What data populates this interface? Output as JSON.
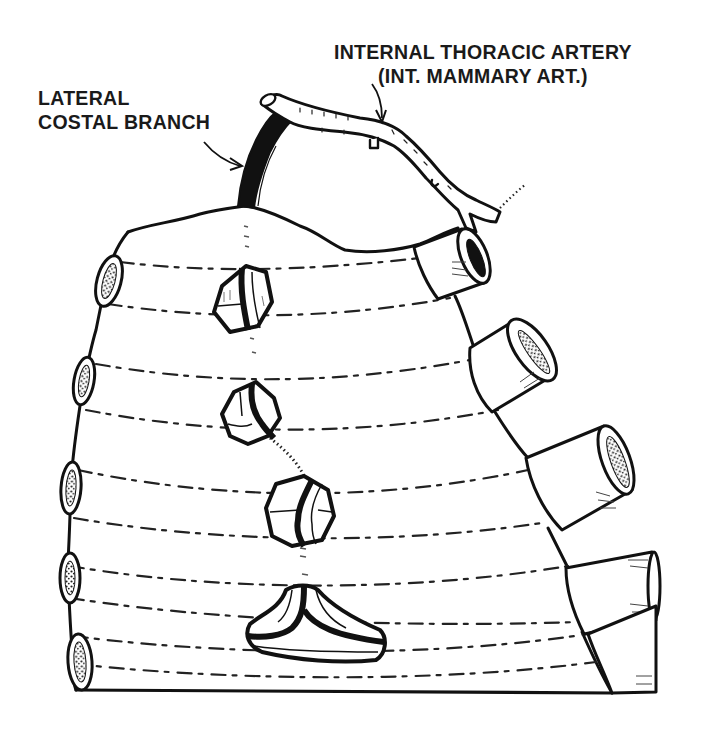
{
  "figure": {
    "colors": {
      "ink": "#111111",
      "paper": "#ffffff",
      "shade": "#555555"
    }
  },
  "labels": {
    "internal_thoracic_artery": {
      "line1": "INTERNAL THORACIC ARTERY",
      "line2": "(INT. MAMMARY ART.)"
    },
    "lateral_costal_branch": {
      "line1": "LATERAL",
      "line2": "COSTAL BRANCH"
    }
  },
  "structures": {
    "left_rib_ends": [
      "rib-1",
      "rib-2",
      "rib-3",
      "rib-4",
      "rib-5"
    ],
    "right_cut_ribs": [
      "rib-1",
      "rib-2",
      "rib-3",
      "rib-4",
      "rib-5"
    ],
    "sternal_segments": [
      "sternebra-1",
      "sternebra-2",
      "sternebra-3",
      "xiphoid"
    ]
  }
}
